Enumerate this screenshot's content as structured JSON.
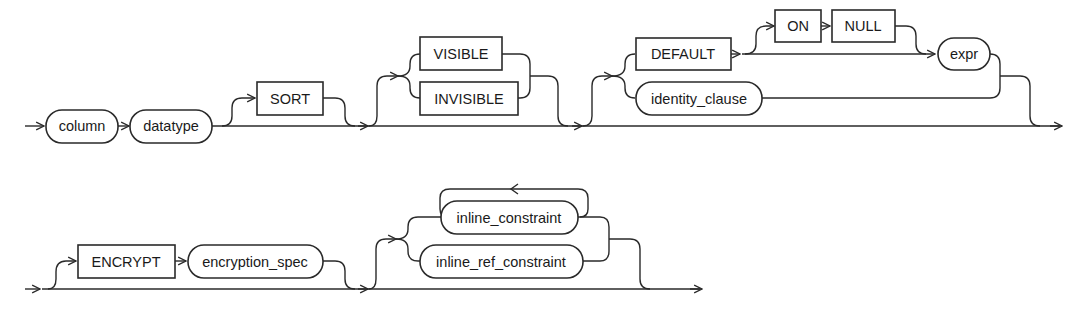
{
  "diagram": {
    "type": "railroad-syntax-diagram",
    "row1": {
      "nonterminals": {
        "column": "column",
        "datatype": "datatype",
        "identity_clause": "identity_clause",
        "expr": "expr"
      },
      "keywords": {
        "sort": "SORT",
        "visible": "VISIBLE",
        "invisible": "INVISIBLE",
        "default": "DEFAULT",
        "on": "ON",
        "null": "NULL"
      }
    },
    "row2": {
      "keywords": {
        "encrypt": "ENCRYPT"
      },
      "nonterminals": {
        "encryption_spec": "encryption_spec",
        "inline_constraint": "inline_constraint",
        "inline_ref_constraint": "inline_ref_constraint"
      }
    },
    "colors": {
      "line": "#2a2a2a",
      "background": "#ffffff"
    }
  }
}
